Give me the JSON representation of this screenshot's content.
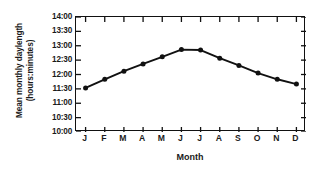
{
  "chart_data": {
    "type": "line",
    "title": "",
    "xlabel": "Month",
    "ylabel": "Mean monthly daylength (hours:minutes)",
    "ylabel_line1": "Mean monthly daylength",
    "ylabel_line2": "(hours:minutes)",
    "categories": [
      "J",
      "F",
      "M",
      "A",
      "M",
      "J",
      "J",
      "A",
      "S",
      "O",
      "N",
      "D"
    ],
    "category_names": [
      "January",
      "February",
      "March",
      "April",
      "May",
      "June",
      "July",
      "August",
      "September",
      "October",
      "November",
      "December"
    ],
    "values": [
      "11:32",
      "11:50",
      "12:07",
      "12:22",
      "12:37",
      "12:52",
      "12:51",
      "12:34",
      "12:19",
      "12:03",
      "11:50",
      "11:40"
    ],
    "values_minutes": [
      692,
      710,
      727,
      742,
      757,
      772,
      771,
      754,
      739,
      723,
      710,
      700
    ],
    "ytick_labels": [
      "14:00",
      "13:30",
      "13:00",
      "12:30",
      "12:00",
      "11:30",
      "11:00",
      "10:30",
      "10:00"
    ],
    "ytick_minutes": [
      840,
      810,
      780,
      750,
      720,
      690,
      660,
      630,
      600
    ],
    "ylim": [
      600,
      840
    ],
    "ylim_labels": [
      "10:00",
      "14:00"
    ],
    "grid": false,
    "legend": null,
    "marker": "filled-circle",
    "line_color": "#111111",
    "marker_color": "#111111",
    "background_color": "#ffffff"
  }
}
